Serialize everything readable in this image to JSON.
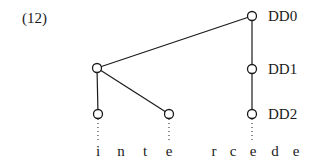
{
  "example_number": "(12)",
  "nodes": {
    "dd0": {
      "label": "DD0",
      "x": 252,
      "y": 16
    },
    "dd1": {
      "label": "DD1",
      "x": 252,
      "y": 69
    },
    "dd2": {
      "label": "DD2",
      "x": 252,
      "y": 114
    },
    "left": {
      "x": 97,
      "y": 68
    },
    "leaf_i": {
      "x": 98,
      "y": 114
    },
    "leaf_e": {
      "x": 169,
      "y": 114
    }
  },
  "letters": [
    {
      "char": "i",
      "x": 98
    },
    {
      "char": "n",
      "x": 121
    },
    {
      "char": "t",
      "x": 145
    },
    {
      "char": "e",
      "x": 169
    },
    {
      "char": "r",
      "x": 214
    },
    {
      "char": "c",
      "x": 233
    },
    {
      "char": "e",
      "x": 255
    },
    {
      "char": "d",
      "x": 275
    },
    {
      "char": "e",
      "x": 296
    }
  ],
  "word": "interceede",
  "colors": {
    "stroke": "#1a1a1a",
    "background": "#ffffff"
  }
}
